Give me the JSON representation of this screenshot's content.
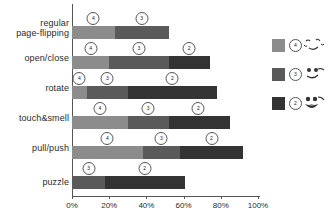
{
  "chart_data": {
    "type": "bar",
    "orientation": "horizontal",
    "stacked": true,
    "title": "",
    "xlabel": "",
    "ylabel": "",
    "xlim": [
      0,
      100
    ],
    "grid": false,
    "legend_position": "right",
    "categories": [
      "regular\npage-flipping",
      "open/close",
      "rotate",
      "touch&smell",
      "pull/push",
      "puzzle"
    ],
    "tick_labels": [
      "0%",
      "20%",
      "40%",
      "60%",
      "80%",
      "100%"
    ],
    "tick_values": [
      0,
      20,
      40,
      60,
      80,
      100
    ],
    "series": [
      {
        "name": "4",
        "color": "#8c8c8c",
        "values": [
          23,
          20,
          8,
          30,
          38,
          0
        ]
      },
      {
        "name": "3",
        "color": "#5a5a5a",
        "values": [
          29,
          32,
          22,
          22,
          20,
          18
        ]
      },
      {
        "name": "2",
        "color": "#333333",
        "values": [
          0,
          22,
          48,
          33,
          34,
          43
        ]
      }
    ],
    "segment_labels": [
      [
        {
          "level": "4",
          "center": 11.5
        },
        {
          "level": "3",
          "center": 37.5
        }
      ],
      [
        {
          "level": "4",
          "center": 10
        },
        {
          "level": "3",
          "center": 36
        },
        {
          "level": "2",
          "center": 63
        }
      ],
      [
        {
          "level": "4",
          "center": 4
        },
        {
          "level": "3",
          "center": 19
        },
        {
          "level": "2",
          "center": 54
        }
      ],
      [
        {
          "level": "4",
          "center": 15
        },
        {
          "level": "3",
          "center": 41
        },
        {
          "level": "2",
          "center": 68
        }
      ],
      [
        {
          "level": "4",
          "center": 19
        },
        {
          "level": "3",
          "center": 48
        },
        {
          "level": "2",
          "center": 75
        }
      ],
      [
        {
          "level": "3",
          "center": 9
        },
        {
          "level": "2",
          "center": 39
        }
      ]
    ]
  },
  "legend": {
    "items": [
      {
        "level": "4",
        "color": "#8c8c8c",
        "face": "winking-face"
      },
      {
        "level": "3",
        "color": "#5a5a5a",
        "face": "smiling-face"
      },
      {
        "level": "2",
        "color": "#333333",
        "face": "laughing-face"
      }
    ]
  }
}
